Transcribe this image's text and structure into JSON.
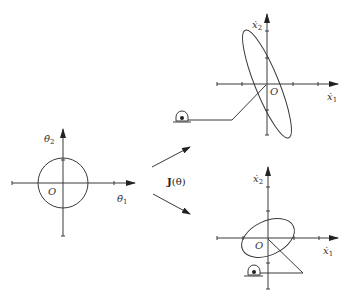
{
  "figure": {
    "colors": {
      "stroke": "#3a3a3a",
      "background": "#ffffff"
    }
  },
  "joint_space": {
    "x_label": "θ̇",
    "x_sub": "1",
    "y_label": "θ̇",
    "y_sub": "2",
    "origin_label": "O",
    "shape": "circle"
  },
  "mapping": {
    "label_bold": "J",
    "label_rest": "(θ)",
    "arrows": [
      "up-right",
      "down-right"
    ]
  },
  "task_space_top": {
    "x_label": "ẋ",
    "x_sub": "1",
    "y_label": "ẋ",
    "y_sub": "2",
    "origin_label": "O",
    "shape": "elongated ellipse",
    "arm": "two-link arm with base pivot"
  },
  "task_space_bottom": {
    "x_label": "ẋ",
    "x_sub": "1",
    "y_label": "ẋ",
    "y_sub": "2",
    "origin_label": "O",
    "shape": "tilted ellipse",
    "arm": "two-link arm with base pivot"
  }
}
